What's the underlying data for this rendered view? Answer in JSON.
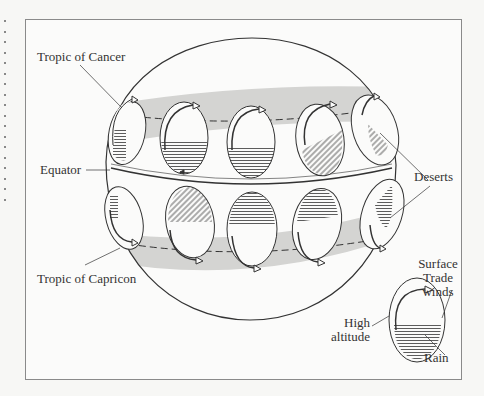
{
  "diagram": {
    "labels": {
      "tropic_of_cancer": "Tropic of Cancer",
      "equator": "Equator",
      "tropic_of_capricorn": "Tropic of Capricon",
      "deserts": "Deserts",
      "legend_surface": "Surface",
      "legend_trade": "Trade",
      "legend_winds": "winds",
      "legend_high": "High",
      "legend_altitude": "altitude",
      "legend_rain": "Rain"
    },
    "colors": {
      "desert_band": "#d4d4d2",
      "line": "#333333",
      "background": "#fbfbfa"
    },
    "cells_north": 5,
    "cells_south": 5
  }
}
